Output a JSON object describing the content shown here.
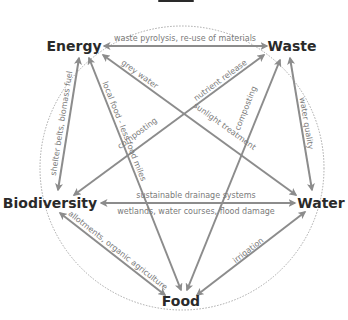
{
  "diagram": {
    "type": "cycle-network",
    "colors": {
      "line": "#8c8c8c",
      "node_text": "#2a2a2a",
      "edge_text": "#7a7a7a",
      "ring": "#a8a8a8"
    },
    "nodes": [
      {
        "id": "energy",
        "label": "Energy"
      },
      {
        "id": "waste",
        "label": "Waste"
      },
      {
        "id": "water",
        "label": "Water"
      },
      {
        "id": "food",
        "label": "Food"
      },
      {
        "id": "biodiversity",
        "label": "Biodiversity"
      }
    ],
    "edges": [
      {
        "from": "waste",
        "to": "energy",
        "direction": "both",
        "labels": [
          "waste pyrolysis, re-use of materials"
        ]
      },
      {
        "from": "water",
        "to": "energy",
        "direction": "both",
        "labels": [
          "grey water",
          "sunlight treatment"
        ]
      },
      {
        "from": "biodiversity",
        "to": "waste",
        "direction": "both",
        "labels": [
          "nutrient release",
          "composting"
        ]
      },
      {
        "from": "food",
        "to": "energy",
        "direction": "both",
        "labels": [
          "local food - less food miles"
        ]
      },
      {
        "from": "food",
        "to": "waste",
        "direction": "both",
        "labels": [
          "composting"
        ]
      },
      {
        "from": "biodiversity",
        "to": "energy",
        "direction": "both",
        "labels": [
          "shelter belts, biomass fuel"
        ]
      },
      {
        "from": "waste",
        "to": "water",
        "direction": "both",
        "labels": [
          "water quality"
        ]
      },
      {
        "from": "biodiversity",
        "to": "water",
        "direction": "both",
        "labels": [
          "sustainable drainage systems",
          "wetlands, water courses, flood damage"
        ]
      },
      {
        "from": "biodiversity",
        "to": "food",
        "direction": "both",
        "labels": [
          "allotments, organic agriculture"
        ]
      },
      {
        "from": "water",
        "to": "food",
        "direction": "both",
        "labels": [
          "irrigation"
        ]
      }
    ]
  }
}
